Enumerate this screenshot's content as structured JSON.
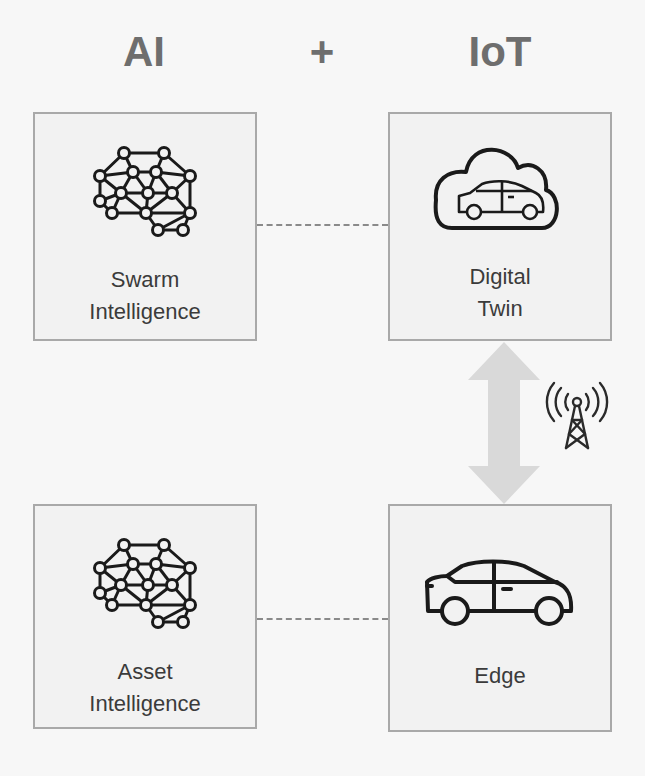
{
  "header": {
    "left_title": "AI",
    "plus": "+",
    "right_title": "IoT"
  },
  "nodes": {
    "swarm_intelligence": {
      "label_line1": "Swarm",
      "label_line2": "Intelligence",
      "icon": "neural-network-icon"
    },
    "digital_twin": {
      "label_line1": "Digital",
      "label_line2": "Twin",
      "icon": "cloud-car-icon"
    },
    "asset_intelligence": {
      "label_line1": "Asset",
      "label_line2": "Intelligence",
      "icon": "neural-network-icon"
    },
    "edge": {
      "label_line1": "Edge",
      "icon": "car-icon"
    }
  },
  "connectors": {
    "swarm_to_digital_twin": "dashed-line",
    "asset_to_edge": "dashed-line",
    "digital_twin_to_edge": "bidirectional-arrow",
    "wireless_icon": "radio-tower-icon"
  },
  "colors": {
    "title": "#6e6e6e",
    "box_border": "#a9a9a9",
    "box_fill": "#f2f2f2",
    "icon_stroke": "#1a1a1a",
    "arrow_fill": "#d9d9d9",
    "label_text": "#3b3b3b"
  }
}
